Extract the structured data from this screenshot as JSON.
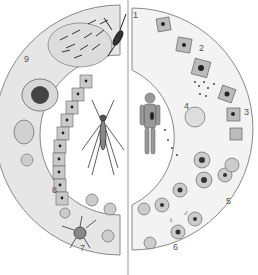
{
  "diagram": {
    "type": "life-cycle",
    "left_half": "mosquito stages",
    "right_half": "human stages",
    "center_left": "mosquito",
    "center_right": "human",
    "stage_labels": [
      {
        "id": "1",
        "text": "1"
      },
      {
        "id": "2",
        "text": "2"
      },
      {
        "id": "3",
        "text": "3"
      },
      {
        "id": "4",
        "text": "4"
      },
      {
        "id": "5",
        "text": "5"
      },
      {
        "id": "6",
        "text": "6"
      },
      {
        "id": "7",
        "text": "7"
      },
      {
        "id": "8",
        "text": "8"
      },
      {
        "id": "9",
        "text": "9"
      }
    ],
    "symbols": {
      "female": "♀",
      "male": "♂"
    },
    "colors": {
      "ring_fill": "#e6e6e6",
      "ring_stroke": "#888888",
      "cell_fill": "#c9c9c9",
      "dark": "#333333"
    }
  }
}
